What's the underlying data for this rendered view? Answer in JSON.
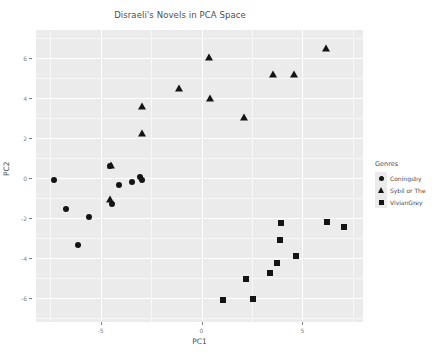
{
  "chart_data": {
    "type": "scatter",
    "title": "Disraeli's Novels in PCA Space",
    "xlabel": "PC1",
    "ylabel": "PC2",
    "xlim": [
      -8.2,
      8.0
    ],
    "ylim": [
      -7.2,
      7.4
    ],
    "xticks": [
      -5,
      0,
      5
    ],
    "yticks": [
      -6,
      -4,
      -2,
      0,
      2,
      4,
      6
    ],
    "grid": true,
    "legend_title": "Genres",
    "legend_position": "right",
    "series": [
      {
        "name": "Coningsby",
        "marker": "circle",
        "color": "#141414",
        "points": [
          [
            -7.3,
            -0.1
          ],
          [
            -6.7,
            -1.55
          ],
          [
            -6.1,
            -3.35
          ],
          [
            -5.55,
            -1.95
          ],
          [
            -4.55,
            0.6
          ],
          [
            -4.45,
            -1.3
          ],
          [
            -4.1,
            -0.35
          ],
          [
            -3.45,
            -0.2
          ],
          [
            -3.05,
            0.05
          ],
          [
            -2.95,
            -0.1
          ]
        ]
      },
      {
        "name": "Sybil or The",
        "marker": "triangle",
        "color": "#141414",
        "points": [
          [
            -4.55,
            -1.05
          ],
          [
            -4.5,
            0.65
          ],
          [
            -2.95,
            3.6
          ],
          [
            -2.95,
            2.25
          ],
          [
            -1.1,
            4.5
          ],
          [
            0.35,
            6.05
          ],
          [
            0.4,
            4.0
          ],
          [
            2.1,
            3.05
          ],
          [
            3.55,
            5.2
          ],
          [
            4.6,
            5.2
          ],
          [
            6.15,
            6.5
          ]
        ]
      },
      {
        "name": "VivianGrey",
        "marker": "square",
        "color": "#141414",
        "points": [
          [
            1.05,
            -6.1
          ],
          [
            2.2,
            -5.05
          ],
          [
            2.55,
            -6.05
          ],
          [
            3.4,
            -4.75
          ],
          [
            3.75,
            -4.25
          ],
          [
            3.9,
            -3.1
          ],
          [
            3.95,
            -2.25
          ],
          [
            4.7,
            -3.9
          ],
          [
            6.2,
            -2.2
          ],
          [
            7.05,
            -2.45
          ]
        ]
      }
    ]
  }
}
